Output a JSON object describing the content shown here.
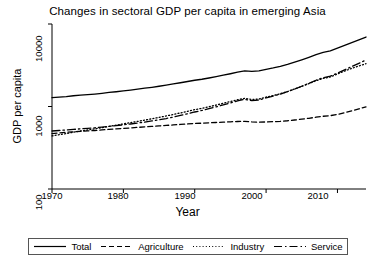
{
  "chart_data": {
    "type": "line",
    "title": "Changes in sectoral GDP per capita in emerging Asia",
    "xlabel": "Year",
    "ylabel": "GDP per capita",
    "yscale": "log",
    "ylim": [
      100,
      10000
    ],
    "xlim": [
      1970,
      2014
    ],
    "yticks": [
      100,
      1000,
      10000
    ],
    "ytick_labels": [
      "100",
      "1000",
      "10000"
    ],
    "xticks": [
      1970,
      1980,
      1990,
      2000,
      2010
    ],
    "xtick_labels": [
      "1970",
      "1980",
      "1990",
      "2000",
      "2010"
    ],
    "grid": false,
    "legend_position": "below-plot",
    "x": [
      1970,
      1971,
      1972,
      1973,
      1974,
      1975,
      1976,
      1977,
      1978,
      1979,
      1980,
      1981,
      1982,
      1983,
      1984,
      1985,
      1986,
      1987,
      1988,
      1989,
      1990,
      1991,
      1992,
      1993,
      1994,
      1995,
      1996,
      1997,
      1998,
      1999,
      2000,
      2001,
      2002,
      2003,
      2004,
      2005,
      2006,
      2007,
      2008,
      2009,
      2010,
      2011,
      2012,
      2013,
      2014
    ],
    "series": [
      {
        "name": "Total",
        "style": "solid",
        "values": [
          1280,
          1300,
          1320,
          1350,
          1370,
          1390,
          1415,
          1445,
          1480,
          1510,
          1545,
          1580,
          1620,
          1665,
          1710,
          1760,
          1815,
          1875,
          1940,
          2010,
          2080,
          2140,
          2215,
          2300,
          2395,
          2495,
          2605,
          2700,
          2660,
          2700,
          2820,
          2930,
          3060,
          3230,
          3440,
          3680,
          3950,
          4260,
          4520,
          4720,
          5100,
          5520,
          5960,
          6430,
          6950
        ],
        "endpoint_value": 6950
      },
      {
        "name": "Agriculture",
        "style": "dashed",
        "values": [
          470,
          478,
          486,
          494,
          500,
          506,
          512,
          520,
          528,
          535,
          542,
          550,
          558,
          566,
          574,
          582,
          590,
          598,
          606,
          614,
          622,
          628,
          634,
          640,
          646,
          652,
          658,
          662,
          650,
          645,
          650,
          655,
          662,
          672,
          686,
          702,
          720,
          742,
          762,
          775,
          800,
          840,
          885,
          935,
          990
        ],
        "endpoint_value": 990
      },
      {
        "name": "Industry",
        "style": "dotted",
        "values": [
          440,
          455,
          470,
          488,
          505,
          520,
          536,
          554,
          574,
          594,
          616,
          638,
          660,
          684,
          710,
          738,
          768,
          800,
          836,
          874,
          915,
          950,
          992,
          1040,
          1092,
          1148,
          1208,
          1255,
          1215,
          1230,
          1300,
          1360,
          1430,
          1520,
          1630,
          1755,
          1895,
          2055,
          2190,
          2280,
          2480,
          2690,
          2900,
          3100,
          3300
        ],
        "endpoint_value": 3300
      },
      {
        "name": "Service",
        "style": "dashdot",
        "values": [
          505,
          512,
          520,
          528,
          536,
          544,
          552,
          562,
          574,
          586,
          600,
          614,
          630,
          648,
          668,
          690,
          715,
          745,
          780,
          818,
          858,
          895,
          940,
          990,
          1045,
          1105,
          1170,
          1220,
          1180,
          1200,
          1275,
          1340,
          1415,
          1510,
          1625,
          1760,
          1910,
          2080,
          2230,
          2330,
          2540,
          2780,
          3050,
          3340,
          3660
        ],
        "endpoint_value": 3660
      }
    ],
    "legend": [
      {
        "label": "Total",
        "style": "solid"
      },
      {
        "label": "Agriculture",
        "style": "dashed"
      },
      {
        "label": "Industry",
        "style": "dotted"
      },
      {
        "label": "Service",
        "style": "dashdot"
      }
    ],
    "colors": {
      "line": "#000000",
      "axis": "#000000",
      "background": "#ffffff"
    }
  }
}
